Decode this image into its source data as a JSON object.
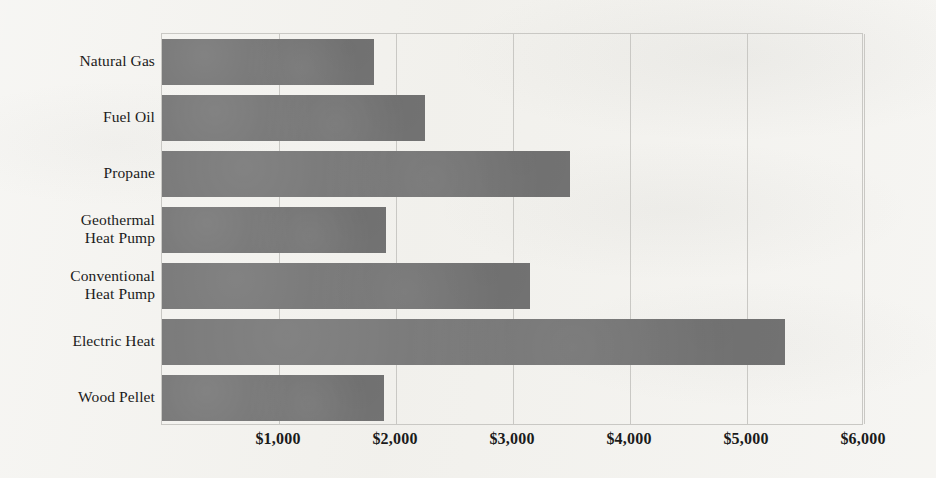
{
  "chart_data": {
    "type": "bar",
    "orientation": "horizontal",
    "title": "",
    "subtitle": "",
    "xlabel": "",
    "ylabel": "",
    "categories": [
      "Natural Gas",
      "Fuel Oil",
      "Propane",
      "Geothermal Heat Pump",
      "Conventional Heat Pump",
      "Electric Heat",
      "Wood Pellet"
    ],
    "category_label_lines": [
      [
        "Natural Gas"
      ],
      [
        "Fuel Oil"
      ],
      [
        "Propane"
      ],
      [
        "Geothermal",
        "Heat Pump"
      ],
      [
        "Conventional",
        "Heat Pump"
      ],
      [
        "Electric Heat"
      ],
      [
        "Wood Pellet"
      ]
    ],
    "values": [
      1810,
      2250,
      3490,
      1915,
      3145,
      5325,
      1900
    ],
    "xlim": [
      0,
      6000
    ],
    "xticks": [
      1000,
      2000,
      3000,
      4000,
      5000,
      6000
    ],
    "xtick_labels": [
      "$1,000",
      "$2,000",
      "$3,000",
      "$4,000",
      "$5,000",
      "$6,000"
    ],
    "grid": true,
    "grid_axis": "x",
    "legend": null,
    "series_name": "Annual heating cost",
    "value_prefix": "$",
    "bar_color": "#767676",
    "gridline_color": "#c9c8c4",
    "background_color": "#f2f1ed",
    "text_color": "#1b1b1b"
  }
}
